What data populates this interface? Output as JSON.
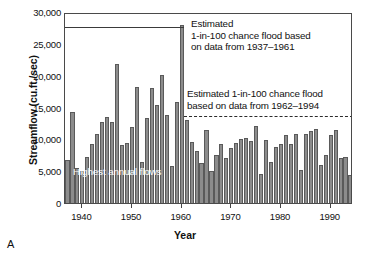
{
  "figure": {
    "panel_label": "A"
  },
  "chart_data": {
    "type": "bar",
    "title": "",
    "xlabel": "Year",
    "ylabel": "Streamflow (cu.ft./sec)",
    "xlim": [
      1936.5,
      1994.5
    ],
    "ylim": [
      0,
      30000
    ],
    "grid": false,
    "legend": "none",
    "bar_color": "#8c8c8c",
    "bar_edge_color": "#5a5a5a",
    "y_ticks": [
      0,
      5000,
      10000,
      15000,
      20000,
      25000,
      30000
    ],
    "y_tick_labels": [
      "0",
      "5,000",
      "10,000",
      "15,000",
      "20,000",
      "25,000",
      "30,000"
    ],
    "x_ticks": [
      1940,
      1950,
      1960,
      1970,
      1980,
      1990
    ],
    "x_tick_labels": [
      "1940",
      "1950",
      "1960",
      "1970",
      "1980",
      "1990"
    ],
    "categories": [
      1937,
      1938,
      1939,
      1940,
      1941,
      1942,
      1943,
      1944,
      1945,
      1946,
      1947,
      1948,
      1949,
      1950,
      1951,
      1952,
      1953,
      1954,
      1955,
      1956,
      1957,
      1958,
      1959,
      1960,
      1961,
      1962,
      1963,
      1964,
      1965,
      1966,
      1967,
      1968,
      1969,
      1970,
      1971,
      1972,
      1973,
      1974,
      1975,
      1976,
      1977,
      1978,
      1979,
      1980,
      1981,
      1982,
      1983,
      1984,
      1985,
      1986,
      1987,
      1988,
      1989,
      1990,
      1991,
      1992,
      1993,
      1994
    ],
    "values": [
      6800,
      14300,
      5500,
      5000,
      7300,
      9300,
      10800,
      12800,
      13500,
      12700,
      21900,
      9100,
      9500,
      11900,
      18300,
      6400,
      13400,
      18100,
      15400,
      20100,
      13800,
      5800,
      15800,
      28000,
      13100,
      9600,
      8100,
      6300,
      11400,
      5000,
      7600,
      9200,
      7100,
      8700,
      9400,
      10000,
      10200,
      9700,
      12100,
      4600,
      9900,
      6500,
      8800,
      9300,
      10700,
      9200,
      10800,
      5200,
      10900,
      11300,
      11700,
      6000,
      7600,
      10700,
      11500,
      7000,
      7300,
      4400
    ],
    "series_name": "Highest annual flows",
    "annotations": [
      {
        "name": "estimated-flood-1937-1961",
        "text_lines": [
          "Estimated",
          "1-in-100 chance flood based",
          "on data from 1937–1961"
        ],
        "line_value": 28000,
        "line_style": "solid",
        "line_x_start": 1937,
        "line_x_end": 1960
      },
      {
        "name": "estimated-flood-1962-1994",
        "text_lines": [
          "Estimated 1-in-100 chance flood",
          "based on data from 1962–1994"
        ],
        "line_value": 14000,
        "line_style": "dashed",
        "line_x_start": 1960,
        "line_x_end": 1994
      },
      {
        "name": "highest-annual-flows-label",
        "text_lines": [
          "Highest annual flows"
        ]
      }
    ]
  },
  "labels": {
    "y_axis_title": "Streamflow (cu.ft./sec)",
    "x_axis_title": "Year",
    "highest_annual_flows": "Highest annual flows",
    "annot1_line1": "Estimated",
    "annot1_line2": "1-in-100 chance flood based",
    "annot1_line3": "on data from 1937–1961",
    "annot2_line1": "Estimated 1-in-100 chance flood",
    "annot2_line2": "based on data from 1962–1994"
  }
}
